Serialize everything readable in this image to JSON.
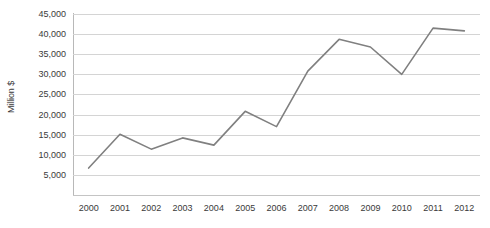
{
  "chart_data": {
    "type": "line",
    "title": "",
    "subtitle": "",
    "xlabel": "",
    "ylabel": "Million $",
    "categories": [
      "2000",
      "2001",
      "2002",
      "2003",
      "2004",
      "2005",
      "2006",
      "2007",
      "2008",
      "2009",
      "2010",
      "2011",
      "2012"
    ],
    "values": [
      6700,
      15100,
      11400,
      14200,
      12400,
      20800,
      17000,
      30800,
      38700,
      36800,
      30000,
      41500,
      40800
    ],
    "series": [
      {
        "name": "",
        "values": [
          6700,
          15100,
          11400,
          14200,
          12400,
          20800,
          17000,
          30800,
          38700,
          36800,
          30000,
          41500,
          40800
        ]
      }
    ],
    "ylim": [
      0,
      45000
    ],
    "yticks": [
      5000,
      10000,
      15000,
      20000,
      25000,
      30000,
      35000,
      40000,
      45000
    ],
    "ytick_labels": [
      "5,000",
      "10,000",
      "15,000",
      "20,000",
      "25,000",
      "30,000",
      "35,000",
      "40,000",
      "45,000"
    ],
    "grid": true,
    "grid_axis": "y",
    "legend": false,
    "legend_position": "none",
    "line_color": "#808080",
    "grid_color": "#d4d4d4",
    "axis_color": "#b8b8b8",
    "text_color": "#3a3a3a",
    "background": "#ffffff",
    "markers": false,
    "annotations": []
  }
}
